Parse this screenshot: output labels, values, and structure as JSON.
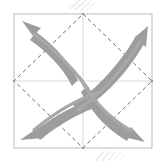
{
  "figure": {
    "title": "Four curved outward arrows within square frame",
    "width": 166,
    "height": 162,
    "background_color": "#ffffff"
  },
  "colors": {
    "background": "#ffffff",
    "frame_stroke": "#b9b9b9",
    "dashed_guide": "#6e6e6e",
    "crosshair": "#d8d8d8",
    "arrow_fill": "#9d9d9d",
    "arrow_fill_light": "#a8a8a8",
    "smudge": "#dcdcdc"
  },
  "frame": {
    "label": "square-frame",
    "x": 14,
    "y": 14,
    "width": 138,
    "height": 134,
    "stroke_width": 1
  },
  "crosshair": {
    "label": "center-crosshair",
    "center_x": 83,
    "center_y": 81,
    "vertical_from_y": 14,
    "vertical_to_y": 148,
    "horizontal_from_x": 14,
    "horizontal_to_x": 152,
    "stroke_width": 1
  },
  "dashed_diamond": {
    "label": "dashed-diamond-guide",
    "vertices": [
      {
        "name": "top-midpoint",
        "x": 83,
        "y": 14
      },
      {
        "name": "right-midpoint",
        "x": 152,
        "y": 81
      },
      {
        "name": "bottom-midpoint",
        "x": 83,
        "y": 148
      },
      {
        "name": "left-midpoint",
        "x": 14,
        "y": 81
      }
    ],
    "dash_pattern": "4 3",
    "stroke_width": 1
  },
  "arrows": [
    {
      "id": "arrow-top-left",
      "label": "top-left-outward-arrow",
      "quadrant": "top-left",
      "direction": "up-left",
      "tip_x": 26,
      "tip_y": 24,
      "tail_x": 80,
      "tail_y": 78,
      "curvature": "convex-outward"
    },
    {
      "id": "arrow-top-right",
      "label": "top-right-outward-arrow",
      "quadrant": "top-right",
      "direction": "up-right",
      "tip_x": 144,
      "tip_y": 30,
      "tail_x": 88,
      "tail_y": 76,
      "curvature": "convex-outward"
    },
    {
      "id": "arrow-bottom-left",
      "label": "bottom-left-outward-arrow",
      "quadrant": "bottom-left",
      "direction": "down-left",
      "tip_x": 22,
      "tip_y": 132,
      "tail_x": 80,
      "tail_y": 86,
      "curvature": "convex-outward"
    },
    {
      "id": "arrow-bottom-right",
      "label": "bottom-right-outward-arrow",
      "quadrant": "bottom-right",
      "direction": "down-right",
      "tip_x": 140,
      "tip_y": 140,
      "tail_x": 88,
      "tail_y": 86,
      "curvature": "convex-outward"
    }
  ],
  "smudges": [
    {
      "id": "smudge-top",
      "label": "faint-hatch-top",
      "x": 72,
      "y": 2
    },
    {
      "id": "smudge-bottom",
      "label": "faint-hatch-bottom",
      "x": 98,
      "y": 150
    }
  ]
}
